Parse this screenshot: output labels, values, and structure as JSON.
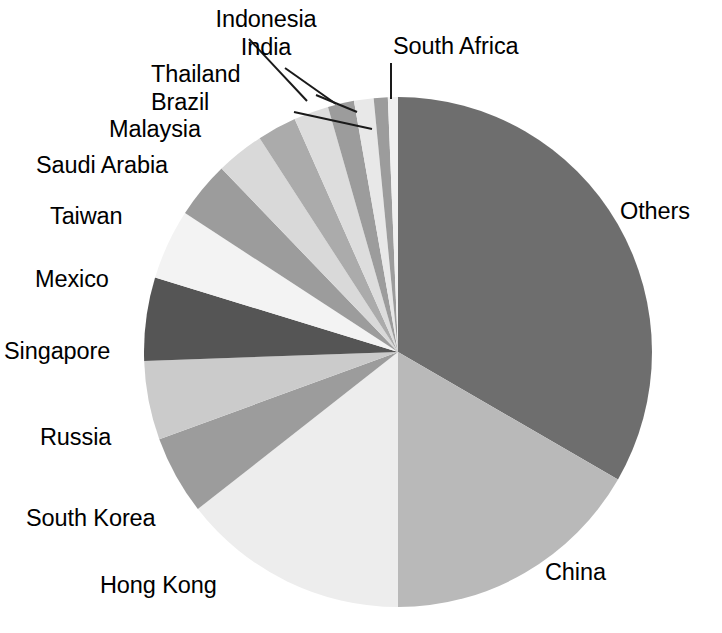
{
  "chart": {
    "type": "pie",
    "title": "",
    "subtitle": "",
    "background_color": "#ffffff",
    "label_color": "#000000",
    "leader_line_color": "#1a1a1a"
  },
  "chart_data": {
    "type": "pie",
    "title": "",
    "xlabel": "",
    "ylabel": "",
    "legend_position": "none",
    "grid": false,
    "labels_outside": true,
    "start_angle_deg_from_12oclock": 0,
    "direction": "clockwise",
    "categories": [
      "Others",
      "China",
      "Hong Kong",
      "South Korea",
      "Russia",
      "Singapore",
      "Mexico",
      "Taiwan",
      "Saudi Arabia",
      "Malaysia",
      "Brazil",
      "Thailand",
      "India",
      "Indonesia",
      "South Africa"
    ],
    "values": [
      33.3,
      16.7,
      14.4,
      5.0,
      5.0,
      5.3,
      4.4,
      3.6,
      3.0,
      2.5,
      2.2,
      1.7,
      1.2,
      0.9,
      0.8
    ],
    "units": "percent",
    "slices": [
      {
        "label": "Others",
        "value": 33.3,
        "start_deg": 0.0,
        "end_deg": 120.0,
        "color": "#6e6e6e"
      },
      {
        "label": "China",
        "value": 16.7,
        "start_deg": 120.0,
        "end_deg": 180.0,
        "color": "#b9b9b9"
      },
      {
        "label": "Hong Kong",
        "value": 14.4,
        "start_deg": 180.0,
        "end_deg": 232.0,
        "color": "#ededed"
      },
      {
        "label": "South Korea",
        "value": 5.0,
        "start_deg": 232.0,
        "end_deg": 250.0,
        "color": "#9c9c9c"
      },
      {
        "label": "Russia",
        "value": 5.0,
        "start_deg": 250.0,
        "end_deg": 268.0,
        "color": "#cbcbcb"
      },
      {
        "label": "Singapore",
        "value": 5.3,
        "start_deg": 268.0,
        "end_deg": 287.0,
        "color": "#555555"
      },
      {
        "label": "Mexico",
        "value": 4.4,
        "start_deg": 287.0,
        "end_deg": 303.0,
        "color": "#f3f3f3"
      },
      {
        "label": "Taiwan",
        "value": 3.6,
        "start_deg": 303.0,
        "end_deg": 316.0,
        "color": "#9c9c9c"
      },
      {
        "label": "Saudi Arabia",
        "value": 3.0,
        "start_deg": 316.0,
        "end_deg": 327.0,
        "color": "#d9d9d9"
      },
      {
        "label": "Malaysia",
        "value": 2.5,
        "start_deg": 327.0,
        "end_deg": 336.0,
        "color": "#ababab"
      },
      {
        "label": "Brazil",
        "value": 2.2,
        "start_deg": 336.0,
        "end_deg": 344.0,
        "color": "#dddddd"
      },
      {
        "label": "Thailand",
        "value": 1.7,
        "start_deg": 344.0,
        "end_deg": 350.0,
        "color": "#9c9c9c"
      },
      {
        "label": "India",
        "value": 1.2,
        "start_deg": 350.0,
        "end_deg": 354.5,
        "color": "#e8e8e8"
      },
      {
        "label": "Indonesia",
        "value": 0.9,
        "start_deg": 354.5,
        "end_deg": 357.7,
        "color": "#9c9c9c"
      },
      {
        "label": "South Africa",
        "value": 0.8,
        "start_deg": 357.7,
        "end_deg": 360.0,
        "color": "#f0f0f0"
      }
    ]
  },
  "labels": {
    "indonesia": "Indonesia",
    "india": "India",
    "south_africa": "South Africa",
    "thailand": "Thailand",
    "brazil": "Brazil",
    "malaysia": "Malaysia",
    "saudi_arabia": "Saudi Arabia",
    "taiwan": "Taiwan",
    "mexico": "Mexico",
    "singapore": "Singapore",
    "russia": "Russia",
    "south_korea": "South Korea",
    "hong_kong": "Hong Kong",
    "china": "China",
    "others": "Others"
  }
}
